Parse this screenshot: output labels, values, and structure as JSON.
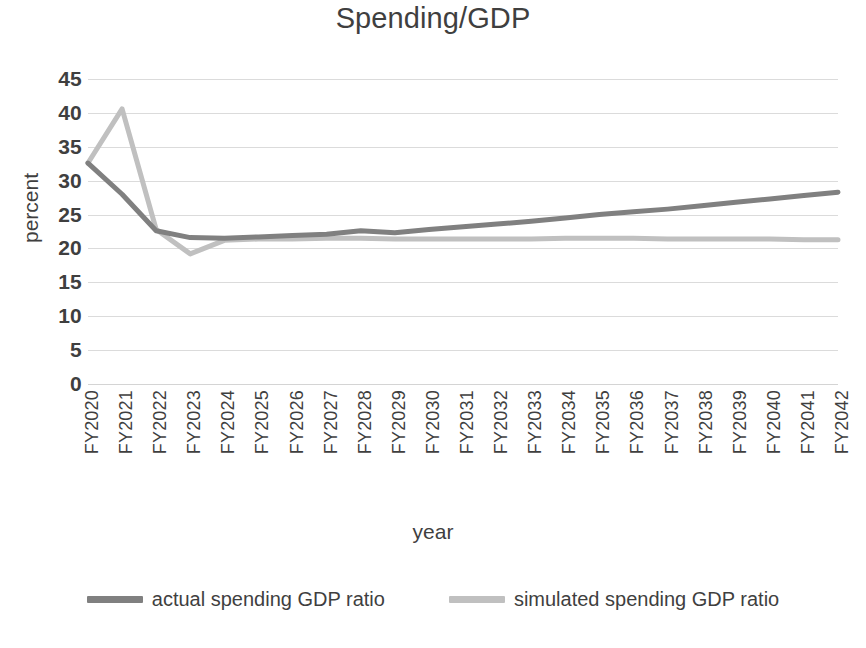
{
  "chart_data": {
    "type": "line",
    "title": "Spending/GDP",
    "xlabel": "year",
    "ylabel": "percent",
    "ylim": [
      0,
      45
    ],
    "yticks": [
      45,
      40,
      35,
      30,
      25,
      20,
      15,
      10,
      5,
      0
    ],
    "grid": true,
    "legend_position": "bottom",
    "categories": [
      "FY2020",
      "FY2021",
      "FY2022",
      "FY2023",
      "FY2024",
      "FY2025",
      "FY2026",
      "FY2027",
      "FY2028",
      "FY2029",
      "FY2030",
      "FY2031",
      "FY2032",
      "FY2033",
      "FY2034",
      "FY2035",
      "FY2036",
      "FY2037",
      "FY2038",
      "FY2039",
      "FY2040",
      "FY2041",
      "FY2042"
    ],
    "series": [
      {
        "name": "actual spending GDP ratio",
        "color": "#808080",
        "values": [
          32.6,
          28.0,
          22.6,
          21.6,
          21.5,
          21.7,
          21.9,
          22.1,
          22.6,
          22.3,
          22.8,
          23.2,
          23.6,
          24.0,
          24.5,
          25.0,
          25.4,
          25.8,
          26.3,
          26.8,
          27.3,
          27.8,
          28.3
        ]
      },
      {
        "name": "simulated spending GDP ratio",
        "color": "#c0c0c0",
        "values": [
          32.6,
          40.6,
          22.8,
          19.2,
          21.2,
          21.4,
          21.4,
          21.5,
          21.5,
          21.4,
          21.4,
          21.4,
          21.4,
          21.4,
          21.5,
          21.5,
          21.5,
          21.4,
          21.4,
          21.4,
          21.4,
          21.3,
          21.3
        ]
      }
    ]
  },
  "legend": {
    "items": [
      {
        "label": "actual spending GDP ratio",
        "color": "#808080"
      },
      {
        "label": "simulated spending GDP ratio",
        "color": "#c0c0c0"
      }
    ]
  }
}
